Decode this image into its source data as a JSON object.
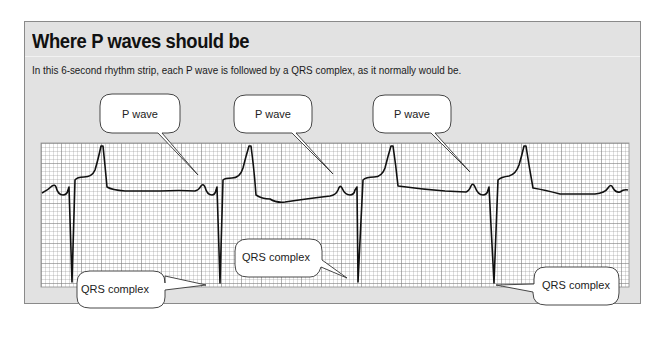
{
  "figure": {
    "title": "Where P waves should be",
    "caption": "In this 6-second rhythm strip, each P wave is followed by a QRS complex, as it normally would be."
  },
  "callouts": {
    "p_wave": [
      {
        "label": "P wave"
      },
      {
        "label": "P wave"
      },
      {
        "label": "P wave"
      }
    ],
    "qrs": [
      {
        "label": "QRS complex"
      },
      {
        "label": "QRS complex"
      },
      {
        "label": "QRS complex"
      }
    ]
  },
  "strip": {
    "type": "ECG rhythm strip",
    "duration_seconds": 6,
    "beats_visible": 4,
    "grid_color": "#9a9a9a",
    "trace_color": "#111111",
    "panel_color": "#e2e2e2"
  }
}
